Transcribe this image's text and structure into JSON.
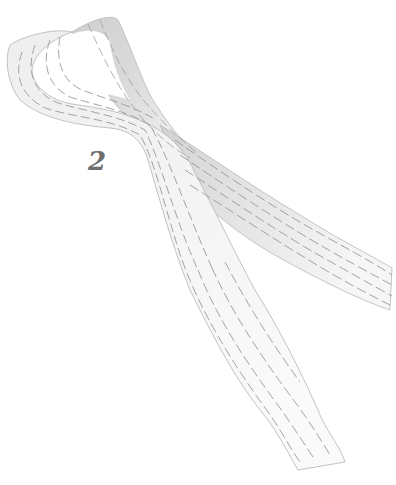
{
  "illustration": {
    "subject": "ribbon loop",
    "step_number": "2",
    "colors": {
      "background": "#ffffff",
      "ribbon_light": "#f4f4f4",
      "ribbon_shadow": "#d4d4d4",
      "stitch": "#9a9a9a",
      "outline": "#b8b8b8",
      "label": "#6e6e6e"
    }
  }
}
